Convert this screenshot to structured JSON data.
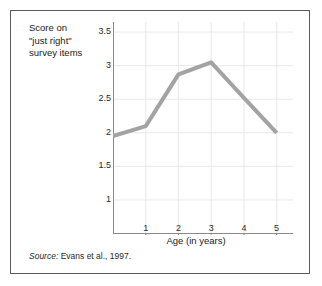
{
  "figure": {
    "ylabel_lines": [
      "Score on",
      "\"just right\"",
      "survey items"
    ],
    "xlabel": "Age (in years)",
    "source_prefix": "Source:",
    "source_text": " Evans et al., 1997.",
    "line_color": "#a3a3a3",
    "grid_color": "#e8e8e8",
    "axis_color": "#8a8a8a",
    "border_color": "#5a5a5a"
  },
  "chart_data": {
    "type": "line",
    "title": "",
    "xlabel": "Age (in years)",
    "ylabel": "Score on \"just right\" survey items",
    "x": [
      0,
      1,
      2,
      3,
      4,
      5
    ],
    "values": [
      1.95,
      2.1,
      2.87,
      3.05,
      2.52,
      2.0
    ],
    "series": [
      {
        "name": "Score on \"just right\" survey items",
        "values": [
          1.95,
          2.1,
          2.87,
          3.05,
          2.52,
          2.0
        ]
      }
    ],
    "xticks": [
      1,
      2,
      3,
      4,
      5
    ],
    "xticklabels": [
      "1",
      "2",
      "3",
      "4",
      "5"
    ],
    "yticks": [
      1,
      1.5,
      2,
      2.5,
      3,
      3.5
    ],
    "yticklabels": [
      "1",
      "1.5",
      "2",
      "2.5",
      "3",
      "3.5"
    ],
    "xlim": [
      0,
      5.5
    ],
    "ylim": [
      0.5,
      3.65
    ],
    "grid": true,
    "legend": "none",
    "annotation": "Source: Evans et al., 1997."
  }
}
